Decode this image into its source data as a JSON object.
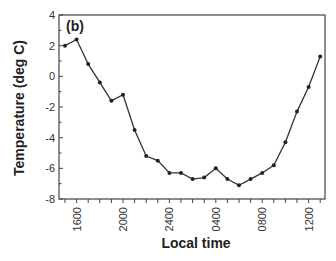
{
  "chart_data": {
    "type": "line",
    "panel_label": "(b)",
    "title": "",
    "xlabel": "Local time",
    "ylabel": "Temperature (deg C)",
    "ylim": [
      -8,
      4
    ],
    "yticks": [
      4,
      2,
      0,
      -2,
      -4,
      -6,
      -8
    ],
    "xtick_labels": [
      "1600",
      "2000",
      "2400",
      "0400",
      "0800",
      "1200"
    ],
    "grid": false,
    "legend": null,
    "series": [
      {
        "name": "Temperature",
        "x": [
          "1500",
          "1600",
          "1700",
          "1800",
          "1900",
          "2000",
          "2100",
          "2200",
          "2300",
          "2400",
          "0100",
          "0200",
          "0300",
          "0400",
          "0500",
          "0600",
          "0700",
          "0800",
          "0900",
          "1000",
          "1100",
          "1200",
          "1300"
        ],
        "values": [
          2.0,
          2.4,
          0.8,
          -0.4,
          -1.6,
          -1.2,
          -3.5,
          -5.2,
          -5.5,
          -6.3,
          -6.3,
          -6.7,
          -6.6,
          -6.0,
          -6.7,
          -7.1,
          -6.7,
          -6.3,
          -5.8,
          -4.3,
          -2.3,
          -0.7,
          1.3
        ]
      }
    ]
  }
}
